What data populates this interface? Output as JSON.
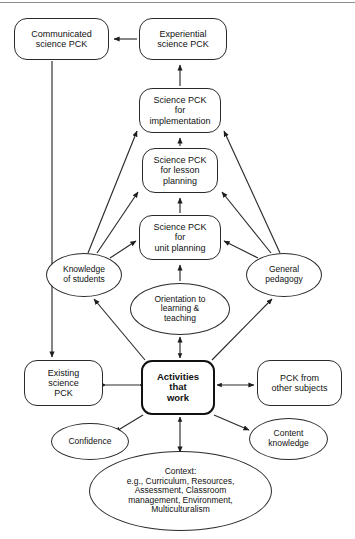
{
  "figure": {
    "kind": "concept-map",
    "title_visible": false,
    "background_color": "#ffffff",
    "line_color": "#2b2b2b",
    "text_color": "#111111"
  },
  "nodes": {
    "communicated_science_pck": {
      "label": "Communicated\nscience PCK",
      "shape": "rounded-rect",
      "x": 14,
      "y": 18,
      "w": 95,
      "h": 42,
      "font_size": 9
    },
    "experiential_science_pck": {
      "label": "Experiential\nscience PCK",
      "shape": "rounded-rect",
      "x": 139,
      "y": 18,
      "w": 88,
      "h": 42,
      "font_size": 9
    },
    "science_pck_implementation": {
      "label": "Science PCK\nfor\nimplementation",
      "shape": "rounded-rect",
      "x": 139,
      "y": 88,
      "w": 82,
      "h": 45,
      "font_size": 9
    },
    "science_pck_lesson_planning": {
      "label": "Science PCK\nfor lesson\nplanning",
      "shape": "rounded-rect",
      "x": 142,
      "y": 148,
      "w": 76,
      "h": 45,
      "font_size": 9
    },
    "science_pck_unit_planning": {
      "label": "Science PCK\nfor\nunit planning",
      "shape": "rounded-rect",
      "x": 139,
      "y": 215,
      "w": 82,
      "h": 45,
      "font_size": 9
    },
    "orientation_learning_teaching": {
      "label": "Orientation to\nlearning &\nteaching",
      "shape": "ellipse",
      "x": 130,
      "y": 283,
      "w": 100,
      "h": 52,
      "font_size": 8.5
    },
    "knowledge_of_students": {
      "label": "Knowledge\nof students",
      "shape": "ellipse",
      "x": 46,
      "y": 253,
      "w": 76,
      "h": 44,
      "font_size": 8.5
    },
    "general_pedagogy": {
      "label": "General\npedagogy",
      "shape": "ellipse",
      "x": 246,
      "y": 253,
      "w": 76,
      "h": 44,
      "font_size": 8.5
    },
    "activities_that_work": {
      "label": "Activities\nthat\nwork",
      "shape": "rounded-rect-thick",
      "x": 141,
      "y": 360,
      "w": 74,
      "h": 55,
      "font_size": 9.5
    },
    "existing_science_pck": {
      "label": "Existing\nscience\nPCK",
      "shape": "rounded-rect",
      "x": 24,
      "y": 360,
      "w": 79,
      "h": 46,
      "font_size": 9
    },
    "pck_from_other_subjects": {
      "label": "PCK from\nother subjects",
      "shape": "rounded-rect",
      "x": 257,
      "y": 360,
      "w": 85,
      "h": 46,
      "font_size": 9
    },
    "confidence": {
      "label": "Confidence",
      "shape": "ellipse",
      "x": 51,
      "y": 423,
      "w": 78,
      "h": 37,
      "font_size": 8.5
    },
    "content_knowledge": {
      "label": "Content\nknowledge",
      "shape": "ellipse",
      "x": 249,
      "y": 418,
      "w": 79,
      "h": 42,
      "font_size": 8.5
    },
    "context": {
      "label": "Context:\ne.g., Curriculum, Resources,\nAssessment, Classroom\nmanagement, Environment,\nMulticulturalism",
      "shape": "ellipse",
      "x": 89,
      "y": 451,
      "w": 183,
      "h": 80,
      "font_size": 8.5
    }
  },
  "edges": [
    {
      "name": "experiential-to-communicated",
      "from": "experiential_science_pck",
      "to": "communicated_science_pck",
      "arrow": "single"
    },
    {
      "name": "implementation-to-experiential",
      "from": "science_pck_implementation",
      "to": "experiential_science_pck",
      "arrow": "single"
    },
    {
      "name": "lesson-to-implementation",
      "from": "science_pck_lesson_planning",
      "to": "science_pck_implementation",
      "arrow": "single"
    },
    {
      "name": "unit-to-lesson",
      "from": "science_pck_unit_planning",
      "to": "science_pck_lesson_planning",
      "arrow": "single"
    },
    {
      "name": "orientation-to-unit",
      "from": "orientation_learning_teaching",
      "to": "science_pck_unit_planning",
      "arrow": "single"
    },
    {
      "name": "knowledge-to-unit",
      "from": "knowledge_of_students",
      "to": "science_pck_unit_planning",
      "arrow": "single"
    },
    {
      "name": "knowledge-to-lesson",
      "from": "knowledge_of_students",
      "to": "science_pck_lesson_planning",
      "arrow": "single"
    },
    {
      "name": "knowledge-to-implementation",
      "from": "knowledge_of_students",
      "to": "science_pck_implementation",
      "arrow": "single"
    },
    {
      "name": "pedagogy-to-unit",
      "from": "general_pedagogy",
      "to": "science_pck_unit_planning",
      "arrow": "single"
    },
    {
      "name": "pedagogy-to-lesson",
      "from": "general_pedagogy",
      "to": "science_pck_lesson_planning",
      "arrow": "single"
    },
    {
      "name": "pedagogy-to-implementation",
      "from": "general_pedagogy",
      "to": "science_pck_implementation",
      "arrow": "single"
    },
    {
      "name": "activities-to-orientation",
      "from": "activities_that_work",
      "to": "orientation_learning_teaching",
      "arrow": "double"
    },
    {
      "name": "activities-to-knowledge",
      "from": "activities_that_work",
      "to": "knowledge_of_students",
      "arrow": "single"
    },
    {
      "name": "activities-to-pedagogy",
      "from": "activities_that_work",
      "to": "general_pedagogy",
      "arrow": "single"
    },
    {
      "name": "activities-to-existing",
      "from": "activities_that_work",
      "to": "existing_science_pck",
      "arrow": "double"
    },
    {
      "name": "activities-to-other-subjects",
      "from": "activities_that_work",
      "to": "pck_from_other_subjects",
      "arrow": "double"
    },
    {
      "name": "activities-to-confidence",
      "from": "activities_that_work",
      "to": "confidence",
      "arrow": "single"
    },
    {
      "name": "activities-to-content",
      "from": "activities_that_work",
      "to": "content_knowledge",
      "arrow": "single"
    },
    {
      "name": "activities-to-context",
      "from": "activities_that_work",
      "to": "context",
      "arrow": "double"
    },
    {
      "name": "communicated-to-existing",
      "from": "communicated_science_pck",
      "to": "existing_science_pck",
      "arrow": "single"
    }
  ]
}
